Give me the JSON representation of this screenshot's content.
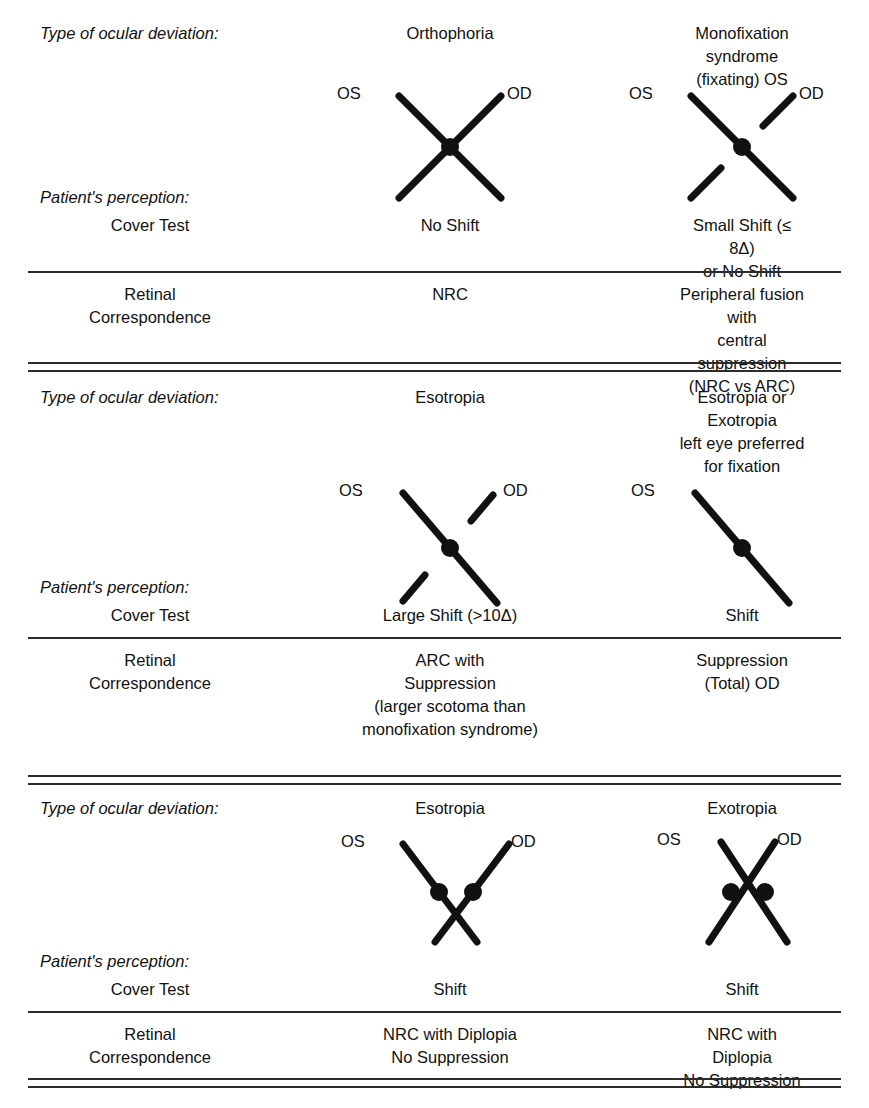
{
  "figure": {
    "type": "comparison-table",
    "row_labels": {
      "deviation": "Type of ocular deviation:",
      "perception": "Patient's perception:",
      "cover_test": "Cover Test",
      "retinal_line1": "Retinal",
      "retinal_line2": "Correspondence"
    },
    "symbols": {
      "os": "OS",
      "od": "OD"
    },
    "sections": [
      {
        "id": "section-1",
        "columns": [
          {
            "id": "orthophoria",
            "deviation": "Orthophoria",
            "cover_test": "No Shift",
            "retinal_correspondence": "NRC",
            "diagram": {
              "kind": "full-x",
              "os_broken": false,
              "od_broken": false,
              "dots": 1
            }
          },
          {
            "id": "monofixation-syndrome",
            "deviation": "Monofixation\nsyndrome (fixating) OS",
            "cover_test": "Small Shift (≤ 8Δ)\nor No Shift",
            "retinal_correspondence": "Peripheral fusion with\ncentral suppression\n(NRC vs ARC)",
            "diagram": {
              "kind": "full-x",
              "os_broken": false,
              "od_broken": true,
              "dots": 1
            }
          }
        ]
      },
      {
        "id": "section-2",
        "columns": [
          {
            "id": "esotropia-arc",
            "deviation": "Esotropia",
            "cover_test": "Large Shift (>10Δ)",
            "retinal_correspondence": "ARC with\nSuppression\n(larger scotoma than\nmonofixation syndrome)",
            "diagram": {
              "kind": "single-diagonal",
              "os_broken": false,
              "od_broken": true,
              "dots": 1
            }
          },
          {
            "id": "suppression-total-od",
            "deviation": "Esotropia or Exotropia\nleft eye preferred\nfor fixation",
            "cover_test": "Shift",
            "retinal_correspondence": "Suppression\n(Total) OD",
            "diagram": {
              "kind": "single-diagonal",
              "os_broken": false,
              "od_broken": true,
              "od_hidden": true,
              "dots": 1
            }
          }
        ]
      },
      {
        "id": "section-3",
        "columns": [
          {
            "id": "esotropia-diplopia",
            "deviation": "Esotropia",
            "cover_test": "Shift",
            "retinal_correspondence": "NRC with Diplopia\nNo Suppression",
            "diagram": {
              "kind": "v-cross-below",
              "dots": 2
            }
          },
          {
            "id": "exotropia-diplopia",
            "deviation": "Exotropia",
            "cover_test": "Shift",
            "retinal_correspondence": "NRC with Diplopia\nNo Suppression",
            "diagram": {
              "kind": "x-cross-above",
              "dots": 2
            }
          }
        ]
      }
    ]
  },
  "style": {
    "ink": "#111111",
    "rule": "#2b2b2b",
    "background": "#ffffff"
  }
}
